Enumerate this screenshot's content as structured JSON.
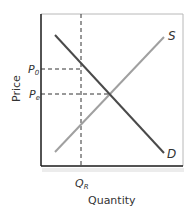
{
  "diagram": {
    "type": "supply-demand",
    "axes": {
      "xlabel": "Quantity",
      "ylabel": "Price"
    },
    "curves": [
      {
        "name": "supply",
        "label": "S",
        "color": "#9a9a9a"
      },
      {
        "name": "demand",
        "label": "D",
        "color": "#4a4a4a"
      }
    ],
    "price_levels": [
      {
        "label_main": "P",
        "label_sub": "0",
        "description": "price at restricted quantity"
      },
      {
        "label_main": "P",
        "label_sub": "e",
        "description": "equilibrium price"
      }
    ],
    "quantity_levels": [
      {
        "label_main": "Q",
        "label_sub": "R",
        "description": "restricted quantity"
      }
    ]
  }
}
